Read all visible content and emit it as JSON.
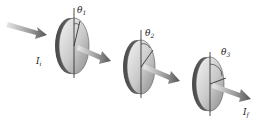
{
  "diagram": {
    "type": "polarizer-sequence",
    "input_intensity": {
      "symbol": "I",
      "subscript": "i"
    },
    "output_intensity": {
      "symbol": "I",
      "subscript": "f"
    },
    "polarizers": [
      {
        "angle_symbol": "θ",
        "angle_subscript": "1"
      },
      {
        "angle_symbol": "θ",
        "angle_subscript": "2"
      },
      {
        "angle_symbol": "θ",
        "angle_subscript": "3"
      }
    ]
  }
}
